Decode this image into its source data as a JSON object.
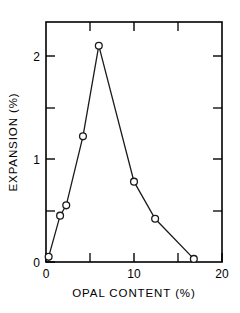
{
  "chart_data": {
    "type": "line",
    "title": "",
    "subtitle": "",
    "xlabel": "OPAL CONTENT (%)",
    "ylabel": "EXPANSION (%)",
    "xlim": [
      0,
      20
    ],
    "ylim": [
      0,
      2.33
    ],
    "grid": false,
    "legend": null,
    "marker": "open-circle",
    "x_ticks_major": [
      0,
      10,
      20
    ],
    "x_tick_labels": [
      "0",
      "10",
      "20"
    ],
    "x_ticks_minor": [
      5,
      15
    ],
    "y_ticks_major": [
      0,
      1,
      2
    ],
    "y_tick_labels": [
      "0",
      "1",
      "2"
    ],
    "y_ticks_minor": [
      0.5,
      1.5
    ],
    "x": [
      0.3,
      1.6,
      2.3,
      4.2,
      6.0,
      10.0,
      12.4,
      16.8
    ],
    "values": [
      0.05,
      0.45,
      0.55,
      1.22,
      2.1,
      0.78,
      0.42,
      0.03
    ],
    "series": [
      {
        "name": "expansion",
        "points": [
          {
            "x": 0.3,
            "y": 0.05
          },
          {
            "x": 1.6,
            "y": 0.45
          },
          {
            "x": 2.3,
            "y": 0.55
          },
          {
            "x": 4.2,
            "y": 1.22
          },
          {
            "x": 6.0,
            "y": 2.1
          },
          {
            "x": 10.0,
            "y": 0.78
          },
          {
            "x": 12.4,
            "y": 0.42
          },
          {
            "x": 16.8,
            "y": 0.03
          }
        ]
      }
    ]
  },
  "axes": {
    "x_label": "OPAL CONTENT (%)",
    "y_label": "EXPANSION (%)",
    "x_tick_labels": [
      "0",
      "10",
      "20"
    ],
    "y_tick_labels": [
      "0",
      "1",
      "2"
    ]
  },
  "colors": {
    "line": "#1a1a1a",
    "marker_fill": "#ffffff",
    "marker_stroke": "#1a1a1a",
    "axis": "#000000",
    "background": "#ffffff"
  }
}
